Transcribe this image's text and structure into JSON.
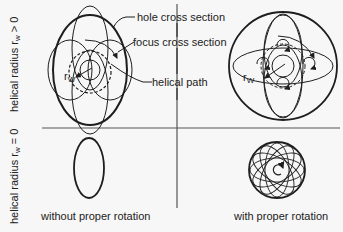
{
  "row_labels": {
    "top": {
      "prefix": "helical radius r",
      "sub": "w",
      "suffix": " > 0"
    },
    "bottom": {
      "prefix": "helical radius r",
      "sub": "w",
      "suffix": " = 0"
    }
  },
  "column_labels": {
    "left": "without proper rotation",
    "right": "with proper rotation"
  },
  "callouts": {
    "hole": "hole cross section",
    "focus": "focus cross section",
    "helical": "helical path"
  },
  "symbols": {
    "rw_left": {
      "main": "r",
      "sub": "W"
    },
    "rw_right": {
      "main": "r",
      "sub": "W"
    }
  },
  "colors": {
    "background": "#f7f7f7",
    "stroke": "#1e1e1e",
    "divider": "#555555"
  }
}
